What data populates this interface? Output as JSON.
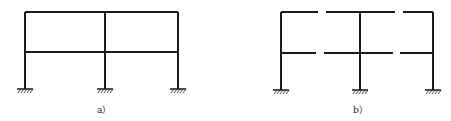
{
  "figures": [
    {
      "id": "a",
      "caption": "a）",
      "description": "Two-bay two-story rigid frame with fixed supports",
      "columns_x": [
        25,
        105,
        178
      ],
      "beams_y": [
        12,
        52
      ],
      "base_y": 89,
      "beam_gaps": []
    },
    {
      "id": "b",
      "caption": "b）",
      "description": "Same frame with beams cut (released) near midspans",
      "columns_x": [
        281,
        360,
        433
      ],
      "beams_y": [
        12,
        53
      ],
      "base_y": 90,
      "beam_gaps": [
        {
          "beam": 0,
          "from": 318,
          "to": 326
        },
        {
          "beam": 0,
          "from": 395,
          "to": 403
        },
        {
          "beam": 1,
          "from": 316,
          "to": 324
        },
        {
          "beam": 1,
          "from": 393,
          "to": 400
        }
      ]
    }
  ],
  "colors": {
    "line": "#1a1a1a",
    "background": "#ffffff"
  }
}
